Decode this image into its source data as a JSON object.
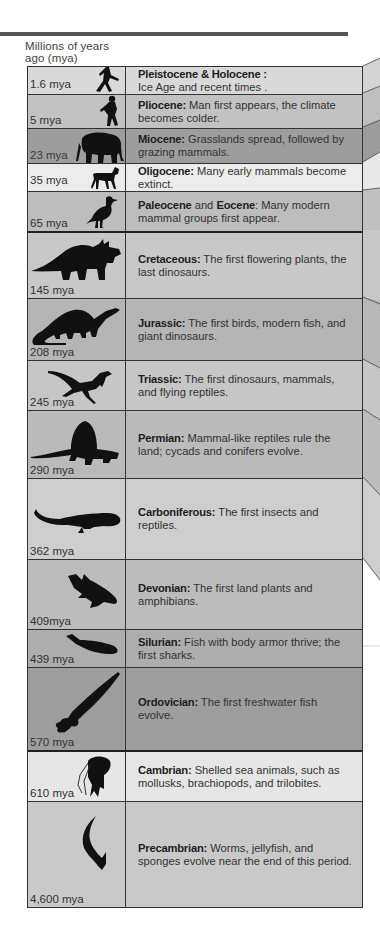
{
  "header": {
    "axis_label_line1": "Millions of years",
    "axis_label_line2": "ago (mya)"
  },
  "colors": {
    "border": "#333333",
    "top_rule": "#555555"
  },
  "periods": [
    {
      "mya": "1.6 mya",
      "name": "Pleistocene & Holocene :",
      "text": "Ice Age and recent  times .",
      "icon": "running-man-icon",
      "bg": "#d9d9d9",
      "height": 27
    },
    {
      "mya": "5 mya",
      "name": "Pliocene:",
      "text": " Man first appears, the climate becomes colder.",
      "icon": "early-human-icon",
      "bg": "#c2c2c2",
      "height": 34
    },
    {
      "mya": "23 mya",
      "name": "Miocene:",
      "text": " Grasslands spread, followed by grazing mammals.",
      "icon": "elephant-icon",
      "bg": "#9d9d9d",
      "height": 35
    },
    {
      "mya": "35 mya",
      "name": "Oligocene:",
      "text": " Many early mammals become extinct.",
      "icon": "horse-icon",
      "bg": "#ececec",
      "height": 28
    },
    {
      "mya": "65 mya",
      "name": "Paleocene",
      "name2": "Eocene",
      "joiner": " and ",
      "text": ": Many modern mammal groups first appear.",
      "icon": "bird-icon",
      "bg": "#bdbdbd",
      "height": 40
    },
    {
      "mya": "145 mya",
      "name": "Cretaceous:",
      "text": " The first flowering plants, the last dinosaurs.",
      "icon": "triceratops-icon",
      "bg": "#c8c8c8",
      "height": 67
    },
    {
      "mya": "208 mya",
      "name": "Jurassic:",
      "text": " The first birds, modern fish, and giant dinosaurs.",
      "icon": "brontosaurus-icon",
      "bg": "#b5b5b5",
      "height": 62
    },
    {
      "mya": "245 mya",
      "name": "Triassic:",
      "text": " The first dinosaurs, mammals, and flying reptiles.",
      "icon": "small-dinosaur-icon",
      "bg": "#c6c6c6",
      "height": 50
    },
    {
      "mya": "290 mya",
      "name": "Permian:",
      "text": " Mammal-like reptiles rule the land; cycads and conifers evolve.",
      "icon": "dimetrodon-icon",
      "bg": "#bababa",
      "height": 68
    },
    {
      "mya": "362 mya",
      "name": "Carboniferous:",
      "text": " The first insects and reptiles.",
      "icon": "amphibian-icon",
      "bg": "#cecece",
      "height": 81
    },
    {
      "mya": "409mya",
      "name": "Devonian:",
      "text": " The first land plants and amphibians.",
      "icon": "lobe-finned-fish-icon",
      "bg": "#bcbcbc",
      "height": 70
    },
    {
      "mya": "439 mya",
      "name": "Silurian:",
      "text": " Fish with body armor thrive; the first sharks.",
      "icon": "armored-fish-icon",
      "bg": "#adadad",
      "height": 38
    },
    {
      "mya": "570 mya",
      "name": "Ordovician:",
      "text": " The first freshwater fish evolve.",
      "icon": "nautiloid-icon",
      "bg": "#9e9e9e",
      "height": 83
    },
    {
      "mya": "610 mya",
      "name": "Cambrian:",
      "text": " Shelled sea animals, such as mollusks, brachiopods, and trilobites.",
      "icon": "jellyfish-icon",
      "bg": "#e6e6e6",
      "height": 51
    },
    {
      "mya": "4,600 mya",
      "name": "Precambrian:",
      "text": "  Worms, jellyfish, and sponges evolve near the end of this period.",
      "icon": "worm-icon",
      "bg": "#c9c9c9",
      "height": 106
    }
  ]
}
